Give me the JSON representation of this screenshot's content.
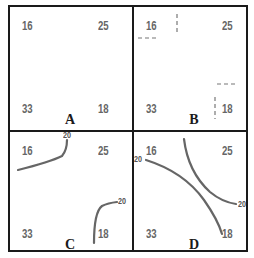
{
  "figure": {
    "panels": [
      {
        "label": "A",
        "values": {
          "top_left": "16",
          "top_right": "25",
          "bottom_left": "33",
          "bottom_right": "18"
        },
        "isolines": []
      },
      {
        "label": "B",
        "values": {
          "top_left": "16",
          "top_right": "25",
          "bottom_left": "33",
          "bottom_right": "18"
        },
        "isolines": [],
        "marks": "dashed tick marks near 16 and 18"
      },
      {
        "label": "C",
        "values": {
          "top_left": "16",
          "top_right": "25",
          "bottom_left": "33",
          "bottom_right": "18"
        },
        "isolines": [
          {
            "value": "20",
            "position": "top-left curve"
          },
          {
            "value": "20",
            "position": "bottom-right curve"
          }
        ]
      },
      {
        "label": "D",
        "values": {
          "top_left": "16",
          "top_right": "25",
          "bottom_left": "33",
          "bottom_right": "18"
        },
        "isolines": [
          {
            "value": "20",
            "position": "diagonal from left edge to bottom-right"
          },
          {
            "value": "20",
            "position": "curve from top-center to right edge"
          }
        ]
      }
    ],
    "colors": {
      "border": "#1a1a1a",
      "value_text": "#666666",
      "isoline": "#666666"
    }
  }
}
